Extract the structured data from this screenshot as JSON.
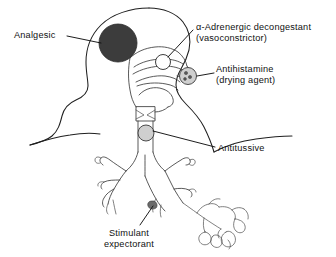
{
  "figure": {
    "background_color": "#ffffff",
    "line_color": "#1f1f1f"
  },
  "labels": {
    "analgesic": {
      "text": "Analgesic",
      "target": "head-pain-site",
      "marker_style": "dark-filled-circle",
      "marker_color": "#3c3c3c"
    },
    "decongestant": {
      "line1": "α-Adrenergic decongestant",
      "line2": "(vasoconstrictor)",
      "target": "nasal-turbinate-site",
      "marker_style": "open-circle",
      "marker_color": "#ffffff"
    },
    "antihistamine": {
      "line1": "Antihistamine",
      "line2": "(drying agent)",
      "target": "mucous-gland-site",
      "marker_style": "gray-circle-with-dots",
      "marker_color": "#cfcfcf"
    },
    "antitussive": {
      "text": "Antitussive",
      "target": "cough-receptor-site",
      "marker_style": "gray-circle",
      "marker_color": "#cfcfcf"
    },
    "expectorant": {
      "line1": "Stimulant",
      "line2": "expectorant",
      "target": "bronchiole-mucus-site",
      "marker_style": "small-dark-blob",
      "marker_color": "#5a5a5a"
    }
  },
  "anatomy": {
    "structures": [
      "head-outline",
      "neck-outline",
      "shoulder-outline",
      "nasal-cavity",
      "nasal-turbinates",
      "soft-palate",
      "tongue",
      "oropharynx",
      "larynx",
      "trachea",
      "carina",
      "right-main-bronchus",
      "left-main-bronchus",
      "bronchial-tree",
      "bronchioles",
      "alveolar-cluster"
    ]
  }
}
